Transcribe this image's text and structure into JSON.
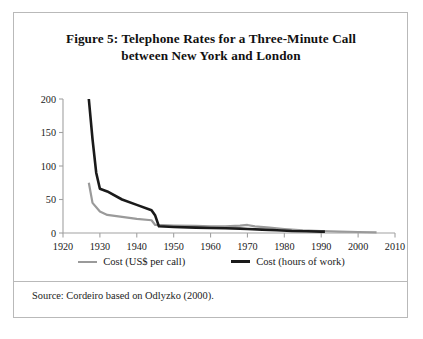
{
  "figure": {
    "title_line_1": "Figure 5: Telephone Rates for a Three-Minute Call",
    "title_line_2": "between New York and London",
    "source": "Source: Cordeiro based on Odlyzko (2000)."
  },
  "legend": {
    "items": [
      {
        "label": "Cost (US$ per call)",
        "color": "#9a9a9a",
        "key": "cost-usd"
      },
      {
        "label": "Cost (hours of work)",
        "color": "#1a1a1a",
        "key": "cost-hours"
      }
    ]
  },
  "chart_data": {
    "type": "line",
    "title": "Figure 5: Telephone Rates for a Three-Minute Call between New York and London",
    "xlabel": "",
    "ylabel": "",
    "xlim": [
      1920,
      2010
    ],
    "ylim": [
      0,
      200
    ],
    "xticks": [
      1920,
      1930,
      1940,
      1950,
      1960,
      1970,
      1980,
      1990,
      2000,
      2010
    ],
    "yticks": [
      0,
      50,
      100,
      150,
      200
    ],
    "grid": false,
    "legend_position": "bottom",
    "source": "Source: Cordeiro based on Odlyzko (2000).",
    "series": [
      {
        "name": "Cost (US$ per call)",
        "color": "#9a9a9a",
        "x": [
          1927,
          1928,
          1930,
          1932,
          1936,
          1940,
          1944,
          1945,
          1950,
          1956,
          1960,
          1964,
          1968,
          1970,
          1972,
          1976,
          1980,
          1985,
          1990,
          1995,
          2000,
          2005
        ],
        "y": [
          75,
          45,
          32,
          27,
          24,
          21,
          19,
          12,
          11,
          10.5,
          10,
          10,
          11,
          12,
          10,
          8,
          6,
          4,
          3,
          2,
          1.5,
          1
        ]
      },
      {
        "name": "Cost (hours of work)",
        "color": "#1a1a1a",
        "x": [
          1927,
          1928,
          1929,
          1930,
          1932,
          1936,
          1940,
          1944,
          1945,
          1946,
          1950,
          1956,
          1960,
          1964,
          1968,
          1970,
          1974,
          1978,
          1982,
          1986,
          1990,
          1991
        ],
        "y": [
          200,
          140,
          90,
          66,
          62,
          50,
          42,
          34,
          26,
          10,
          9,
          8,
          7.5,
          7,
          6.5,
          6,
          5,
          4,
          3,
          2.5,
          2,
          2
        ]
      }
    ]
  }
}
